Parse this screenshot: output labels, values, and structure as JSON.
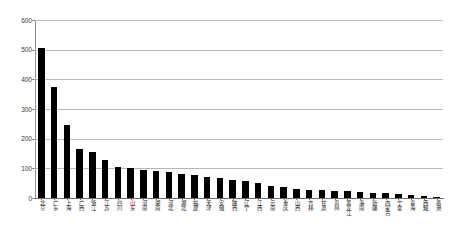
{
  "chart_data": {
    "type": "bar",
    "title": "",
    "subtitle": "",
    "xlabel": "",
    "ylabel": "",
    "ylim": [
      0,
      600
    ],
    "yticks": [
      0,
      100,
      200,
      300,
      400,
      500,
      600
    ],
    "ytick_labels": [
      "0",
      "100",
      "200",
      "300",
      "400",
      "500",
      "600"
    ],
    "grid": "horizontal",
    "legend": "none",
    "bar_color": "#000000",
    "gridline_color": "#b9b9b9",
    "axis_color": "#6f6f6f",
    "background": "#ffffff",
    "categories": [
      "北京",
      "广东",
      "上海",
      "广西",
      "浙江",
      "江苏",
      "四川",
      "山东",
      "河南",
      "湖南",
      "河北",
      "湖北",
      "福建",
      "天津",
      "安徽",
      "陕西",
      "辽宁",
      "江西",
      "云南",
      "重庆",
      "山西",
      "吉林",
      "甘肃",
      "贵州",
      "黑龙江",
      "海南",
      "新疆",
      "内蒙古",
      "宁夏",
      "青海",
      "西藏",
      "香港"
    ],
    "values": [
      505,
      375,
      245,
      165,
      155,
      128,
      103,
      100,
      95,
      92,
      88,
      82,
      78,
      72,
      68,
      62,
      58,
      52,
      42,
      38,
      30,
      28,
      26,
      24,
      22,
      20,
      18,
      16,
      14,
      10,
      6,
      4
    ]
  }
}
